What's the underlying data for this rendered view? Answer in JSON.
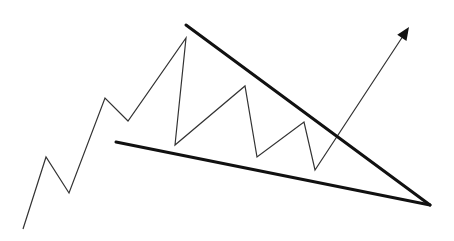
{
  "diagram": {
    "type": "falling-wedge-pattern",
    "background": "#ffffff",
    "colors": {
      "price_line": "#333333",
      "trendlines": "#111111",
      "arrow": "#111111"
    },
    "price_path": [
      [
        23,
        229
      ],
      [
        46,
        157
      ],
      [
        69,
        193
      ],
      [
        105,
        98
      ],
      [
        128,
        121
      ],
      [
        186,
        38
      ],
      [
        175,
        145
      ],
      [
        245,
        86
      ],
      [
        257,
        157
      ],
      [
        304,
        122
      ],
      [
        315,
        170
      ],
      [
        405,
        33
      ]
    ],
    "upper_trendline": [
      [
        186,
        25
      ],
      [
        430,
        205
      ]
    ],
    "lower_trendline": [
      [
        116,
        142
      ],
      [
        430,
        205
      ]
    ],
    "arrow_tip": [
      409,
      27
    ]
  }
}
